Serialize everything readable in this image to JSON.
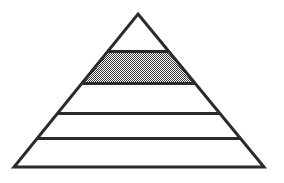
{
  "figure": {
    "title": "Pyramid Diagram",
    "shape": "pyramid",
    "background_color": "#ffffff",
    "stroke_color": "#2b2b2b",
    "stroke_width": 3,
    "fill_color": "#ffffff",
    "highlight_fill_color": "#8a8a8a",
    "highlight_pattern": "halftone-checker",
    "apex": {
      "x": 138,
      "y": 14
    },
    "base_left": {
      "x": 14,
      "y": 167
    },
    "base_right": {
      "x": 264,
      "y": 167
    },
    "divider_y_values": [
      51,
      83,
      113,
      138
    ],
    "tier_count": 5,
    "highlighted_tier_index": 1,
    "tiers": [
      {
        "index": 0,
        "name": "tier-1-apex",
        "label": "",
        "top_y": 14,
        "bottom_y": 51,
        "filled": false,
        "fill": "#ffffff"
      },
      {
        "index": 1,
        "name": "tier-2-shaded",
        "label": "",
        "top_y": 51,
        "bottom_y": 83,
        "filled": true,
        "fill": "#8a8a8a"
      },
      {
        "index": 2,
        "name": "tier-3",
        "label": "",
        "top_y": 83,
        "bottom_y": 113,
        "filled": false,
        "fill": "#ffffff"
      },
      {
        "index": 3,
        "name": "tier-4",
        "label": "",
        "top_y": 113,
        "bottom_y": 138,
        "filled": false,
        "fill": "#ffffff"
      },
      {
        "index": 4,
        "name": "tier-5-base",
        "label": "",
        "top_y": 138,
        "bottom_y": 167,
        "filled": false,
        "fill": "#ffffff"
      }
    ]
  }
}
